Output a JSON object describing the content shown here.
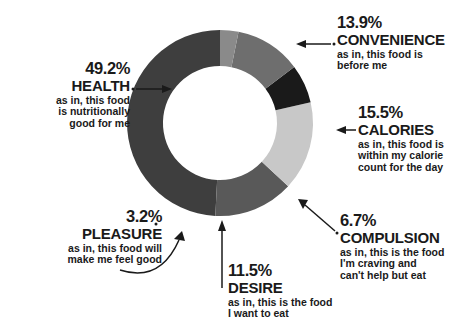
{
  "chart_data": {
    "type": "pie",
    "variant": "donut",
    "title": "",
    "subtitle": "",
    "xlabel": "",
    "ylabel": "",
    "legend_position": "callout-labels",
    "grid": false,
    "units": "percent",
    "total": 100.0,
    "categories": [
      "HEALTH",
      "CONVENIENCE",
      "CALORIES",
      "COMPULSION",
      "DESIRE",
      "PLEASURE"
    ],
    "values": [
      49.2,
      13.9,
      15.5,
      6.7,
      11.5,
      3.2
    ],
    "labels": [
      "49.2%",
      "13.9%",
      "15.5%",
      "6.7%",
      "11.5%",
      "3.2%"
    ],
    "colors": [
      "#3e3e3e",
      "#595959",
      "#c8c8c8",
      "#1a1a1a",
      "#6e6e6e",
      "#8a8a8a"
    ],
    "descriptions": [
      "as in, this food\nis nutritionally\ngood for me",
      "as in, this food is\nbefore me",
      "as in, this food is\nwithin my calorie\ncount for the day",
      "as in, this is the food\nI'm craving and\ncan't help but eat",
      "as in, this is the food\nI want to eat",
      "as in, this food will\nmake me feel good"
    ],
    "geometry": {
      "center_x": 220,
      "center_y": 123,
      "outer_radius": 93,
      "inner_radius": 57,
      "start_angle_deg": -90,
      "direction": "counterclockwise"
    },
    "slices": [
      {
        "category": "HEALTH",
        "value": 49.2,
        "label": "49.2%",
        "color": "#3e3e3e",
        "description": "as in, this food\nis nutritionally\ngood for me"
      },
      {
        "category": "CONVENIENCE",
        "value": 13.9,
        "label": "13.9%",
        "color": "#595959",
        "description": "as in, this food is\nbefore me"
      },
      {
        "category": "CALORIES",
        "value": 15.5,
        "label": "15.5%",
        "color": "#c8c8c8",
        "description": "as in, this food is\nwithin my calorie\ncount for the day"
      },
      {
        "category": "COMPULSION",
        "value": 6.7,
        "label": "6.7%",
        "color": "#1a1a1a",
        "description": "as in, this is the food\nI'm craving and\ncan't help but eat"
      },
      {
        "category": "DESIRE",
        "value": 11.5,
        "label": "11.5%",
        "color": "#6e6e6e",
        "description": "as in, this is the food\nI want to eat"
      },
      {
        "category": "PLEASURE",
        "value": 3.2,
        "label": "3.2%",
        "color": "#8a8a8a",
        "description": "as in, this food will\nmake me feel good"
      }
    ]
  },
  "callouts": {
    "health": {
      "pct": "49.2%",
      "cat": "HEALTH",
      "desc": "as in, this food\nis nutritionally\ngood for me"
    },
    "convenience": {
      "pct": "13.9%",
      "cat": "CONVENIENCE",
      "desc": "as in, this food is\nbefore me"
    },
    "calories": {
      "pct": "15.5%",
      "cat": "CALORIES",
      "desc": "as in, this food is\nwithin my calorie\ncount for the day"
    },
    "compulsion": {
      "pct": "6.7%",
      "cat": "COMPULSION",
      "desc": "as in, this is the food\nI'm craving and\ncan't help but eat"
    },
    "desire": {
      "pct": "11.5%",
      "cat": "DESIRE",
      "desc": "as in, this is the food\nI want to eat"
    },
    "pleasure": {
      "pct": "3.2%",
      "cat": "PLEASURE",
      "desc": "as in, this food will\nmake me feel good"
    }
  }
}
